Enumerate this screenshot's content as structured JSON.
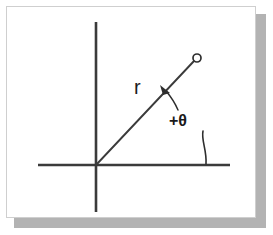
{
  "figure": {
    "kind": "geometry-diagram",
    "background_color": "#ffffff",
    "card": {
      "fill_color": "#ffffff",
      "border_color": "#cfcfcf",
      "shadow_color": "#b3b3b3"
    },
    "ink_color": "#3b3b3b"
  },
  "labels": {
    "radius": "r",
    "angle": "+θ"
  },
  "chart_data": {
    "type": "scatter",
    "title": "",
    "xlabel": "",
    "ylabel": "",
    "axes": {
      "x_axis": {
        "x1": 38,
        "y1": 165,
        "x2": 230,
        "y2": 165
      },
      "y_axis": {
        "x1": 96,
        "y1": 22,
        "x2": 96,
        "y2": 212
      },
      "origin": {
        "x": 96,
        "y": 165
      }
    },
    "elements": [
      {
        "name": "radius-ray",
        "type": "line",
        "from": {
          "x": 96,
          "y": 165
        },
        "to": {
          "x": 194,
          "y": 61
        },
        "label": "r"
      },
      {
        "name": "terminal-point",
        "type": "point",
        "at": {
          "x": 197,
          "y": 58
        },
        "radius": 4
      },
      {
        "name": "angle-marker",
        "type": "annotation",
        "label": "+θ",
        "label_at": {
          "x": 169,
          "y": 113
        },
        "points_to": {
          "x": 162,
          "y": 88
        }
      },
      {
        "name": "axis-angle-tick",
        "type": "annotation",
        "from": {
          "x": 203,
          "y": 131
        },
        "to": {
          "x": 206,
          "y": 164
        }
      }
    ],
    "grid": false,
    "legend": null
  }
}
